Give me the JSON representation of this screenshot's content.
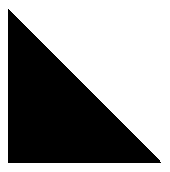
{
  "image": {
    "width": 170,
    "height": 172,
    "background_color": "#ffffff",
    "alt_text": "Solid black right triangle on a white background"
  },
  "shape": {
    "name": "right-triangle",
    "type": "polygon",
    "fill_color": "#000000",
    "stroke_color": "none",
    "right_angle_corner": "bottom-left",
    "hypotenuse": "top-left to bottom-right",
    "points": "8,8 8,163 162,163",
    "vertices": [
      {
        "label": "apex-top-left",
        "x": 8,
        "y": 8
      },
      {
        "label": "corner-bottom-left",
        "x": 8,
        "y": 163
      },
      {
        "label": "corner-bottom-right",
        "x": 162,
        "y": 163
      }
    ],
    "edge_rendering": "aliased"
  }
}
